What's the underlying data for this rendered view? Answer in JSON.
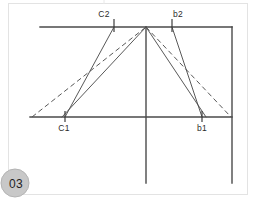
{
  "page": {
    "badge_label": "03",
    "background_color": "#ffffff",
    "frame_color": "#e3e3e3",
    "line_color": "#4a4a4a",
    "badge_color": "#c8c8c8"
  },
  "diagram": {
    "title": "",
    "labels": {
      "c2": "C2",
      "b2": "b2",
      "c1": "C1",
      "b1": "b1"
    },
    "points": {
      "apex": {
        "x": 146,
        "y": 27
      },
      "c2": {
        "x": 114,
        "y": 27
      },
      "b2": {
        "x": 172,
        "y": 27
      },
      "c1": {
        "x": 65,
        "y": 117
      },
      "b1": {
        "x": 202,
        "y": 117
      },
      "base_left": {
        "x": 30,
        "y": 117
      },
      "base_right": {
        "x": 232,
        "y": 117
      },
      "top_left": {
        "x": 40,
        "y": 27
      },
      "top_right": {
        "x": 232,
        "y": 27
      },
      "center_bottom": {
        "x": 146,
        "y": 183
      },
      "right_bottom": {
        "x": 232,
        "y": 183
      }
    },
    "segments": [
      {
        "name": "top-horizontal-axis",
        "style": "solid-axis",
        "x1": 40,
        "y1": 27,
        "x2": 232,
        "y2": 27
      },
      {
        "name": "bottom-horizontal-axis",
        "style": "solid-axis",
        "x1": 30,
        "y1": 117,
        "x2": 232,
        "y2": 117
      },
      {
        "name": "center-vertical-axis",
        "style": "solid-axis",
        "x1": 146,
        "y1": 27,
        "x2": 146,
        "y2": 183
      },
      {
        "name": "right-vertical-axis",
        "style": "solid-axis",
        "x1": 232,
        "y1": 27,
        "x2": 232,
        "y2": 183
      },
      {
        "name": "ray-c2-to-c1",
        "style": "solid-ray",
        "x1": 114,
        "y1": 27,
        "x2": 65,
        "y2": 117
      },
      {
        "name": "ray-apex-to-c1",
        "style": "solid-ray",
        "x1": 146,
        "y1": 27,
        "x2": 62,
        "y2": 117
      },
      {
        "name": "ray-b2-to-b1",
        "style": "solid-ray",
        "x1": 172,
        "y1": 27,
        "x2": 202,
        "y2": 117
      },
      {
        "name": "ray-apex-to-b1",
        "style": "solid-ray",
        "x1": 146,
        "y1": 27,
        "x2": 206,
        "y2": 117
      },
      {
        "name": "dashed-left-to-apex",
        "style": "dashed-ray",
        "x1": 32,
        "y1": 117,
        "x2": 146,
        "y2": 27
      },
      {
        "name": "dashed-apex-to-right",
        "style": "dashed-ray",
        "x1": 146,
        "y1": 27,
        "x2": 231,
        "y2": 117
      }
    ],
    "ticks": [
      {
        "name": "tick-c2",
        "x": 114,
        "y1": 19,
        "y2": 32
      },
      {
        "name": "tick-b2",
        "x": 172,
        "y1": 19,
        "y2": 32
      },
      {
        "name": "tick-c1",
        "x": 65,
        "y1": 111,
        "y2": 122
      },
      {
        "name": "tick-b1",
        "x": 202,
        "y1": 111,
        "y2": 122
      }
    ]
  }
}
